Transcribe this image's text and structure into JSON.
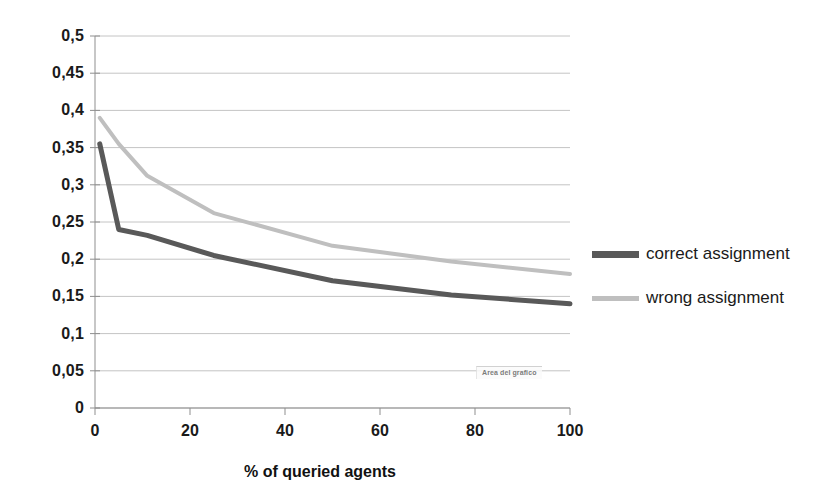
{
  "chart_data": {
    "type": "line",
    "title": "",
    "xlabel": "% of queried agents",
    "ylabel": "",
    "xlim": [
      0,
      100
    ],
    "ylim": [
      0,
      0.5
    ],
    "grid": true,
    "legend_position": "right",
    "x_ticks": [
      "0",
      "20",
      "40",
      "60",
      "80",
      "100"
    ],
    "x_tick_values": [
      0,
      20,
      40,
      60,
      80,
      100
    ],
    "y_ticks": [
      "0",
      "0,05",
      "0,1",
      "0,15",
      "0,2",
      "0,25",
      "0,3",
      "0,35",
      "0,4",
      "0,45",
      "0,5"
    ],
    "y_tick_values": [
      0,
      0.05,
      0.1,
      0.15,
      0.2,
      0.25,
      0.3,
      0.35,
      0.4,
      0.45,
      0.5
    ],
    "decimal_separator": ",",
    "x": [
      1,
      5,
      11,
      25,
      50,
      75,
      100
    ],
    "series": [
      {
        "name": "correct assignment",
        "color": "#595959",
        "width": 5,
        "values": [
          0.355,
          0.24,
          0.232,
          0.205,
          0.171,
          0.152,
          0.14
        ]
      },
      {
        "name": "wrong assignment",
        "color": "#bfbfbf",
        "width": 4,
        "values": [
          0.39,
          0.355,
          0.312,
          0.262,
          0.218,
          0.197,
          0.18
        ]
      }
    ],
    "annotations": [
      {
        "text": "Area del grafico",
        "x": 50,
        "y": 0.055
      }
    ]
  },
  "legend": {
    "items": [
      {
        "label": "correct assignment",
        "color": "#595959"
      },
      {
        "label": "wrong assignment",
        "color": "#bfbfbf"
      }
    ]
  },
  "tooltip": {
    "text": "Area del grafico"
  },
  "colors": {
    "correct": "#595959",
    "wrong": "#bfbfbf",
    "grid": "#c4c4c4",
    "axis": "#8f8f8f",
    "text": "#1a1a1a"
  }
}
